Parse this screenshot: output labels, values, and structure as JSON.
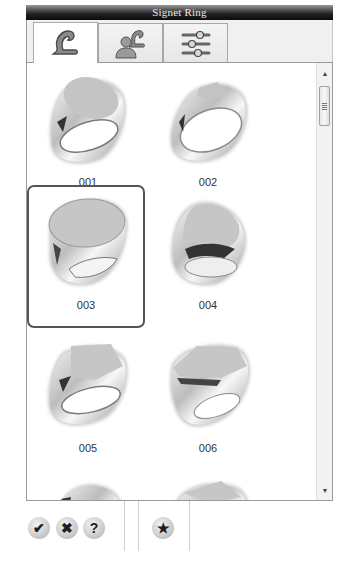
{
  "window": {
    "title": "Signet Ring"
  },
  "tabs": [
    {
      "name": "shape-tab",
      "icon": "pound-style-curve-icon",
      "active": true
    },
    {
      "name": "user-shape-tab",
      "icon": "user-with-curve-icon",
      "active": false
    },
    {
      "name": "settings-tab",
      "icon": "sliders-icon",
      "active": false
    }
  ],
  "gallery": {
    "selected": "003",
    "items": [
      {
        "label": "001",
        "style": "oval-top"
      },
      {
        "label": "002",
        "style": "thin-band-small-top"
      },
      {
        "label": "003",
        "style": "large-oval-top"
      },
      {
        "label": "004",
        "style": "teardrop-top"
      },
      {
        "label": "005",
        "style": "cushion-top"
      },
      {
        "label": "006",
        "style": "hexagon-top"
      },
      {
        "label": "",
        "style": "round-top-partial"
      },
      {
        "label": "",
        "style": "square-top-partial"
      }
    ]
  },
  "scrollbar": {
    "up_icon": "▲",
    "down_icon": "▼"
  },
  "footer": {
    "ok_icon": "✔",
    "cancel_icon": "✖",
    "help_icon": "?",
    "favorite_icon": "★"
  },
  "colors": {
    "selection_border": "#555555",
    "titlebar_dark": "#0c0c0c"
  }
}
